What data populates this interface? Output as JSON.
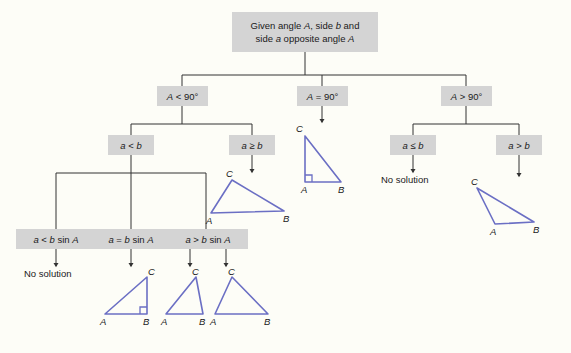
{
  "diagram": {
    "title_text": "Given angle A, side b and side a opposite angle A",
    "colors": {
      "box_fill": "#d4d4d4",
      "background": "#fdfdf7",
      "line": "#333333",
      "triangle_stroke": "#6b6fc4",
      "text": "#1a1a1a"
    },
    "root": {
      "line1": "Given angle A, side b and",
      "line2": "side a opposite angle A"
    },
    "level1": [
      {
        "key": "a-lt-90",
        "label": "A < 90°"
      },
      {
        "key": "a-eq-90",
        "label": "A = 90°"
      },
      {
        "key": "a-gt-90",
        "label": "A > 90°"
      }
    ],
    "level2": [
      {
        "key": "a-lt-b",
        "label": "a < b"
      },
      {
        "key": "a-ge-b",
        "label": "a ≥ b"
      },
      {
        "key": "a-le-b",
        "label": "a ≤ b"
      },
      {
        "key": "a-gt-b",
        "label": "a > b"
      }
    ],
    "level3": [
      {
        "key": "a-lt-bsinA",
        "label": "a < b sin A"
      },
      {
        "key": "a-eq-bsinA",
        "label": "a = b sin A"
      },
      {
        "key": "a-gt-bsinA",
        "label": "a > b sin A"
      }
    ],
    "outcomes": [
      {
        "key": "no-solution-left",
        "label": "No solution"
      },
      {
        "key": "no-solution-right",
        "label": "No solution"
      }
    ],
    "triangles": [
      {
        "key": "right-triangle-at-A",
        "vertices": {
          "A": "A",
          "B": "B",
          "C": "C"
        },
        "right_angle_at": "A"
      },
      {
        "key": "acute-triangle-a-ge-b",
        "vertices": {
          "A": "A",
          "B": "B",
          "C": "C"
        },
        "right_angle_at": null
      },
      {
        "key": "obtuse-triangle-a-gt-b",
        "vertices": {
          "A": "A",
          "B": "B",
          "C": "C"
        },
        "right_angle_at": null
      },
      {
        "key": "right-triangle-at-B",
        "vertices": {
          "A": "A",
          "B": "B",
          "C": "C"
        },
        "right_angle_at": "B"
      },
      {
        "key": "triangle-solution-one",
        "vertices": {
          "A": "A",
          "B": "B",
          "C": "C"
        },
        "right_angle_at": null
      },
      {
        "key": "triangle-solution-two",
        "vertices": {
          "A": "A",
          "B": "B",
          "C": "C"
        },
        "right_angle_at": null
      }
    ],
    "vertex_labels": {
      "A": "A",
      "B": "B",
      "C": "C"
    }
  }
}
